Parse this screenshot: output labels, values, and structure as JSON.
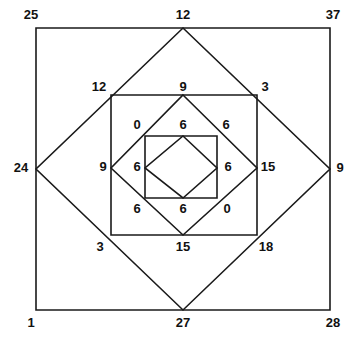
{
  "figure": {
    "type": "geometric-diagram",
    "stroke_color": "#1a1a1a",
    "background_color": "#ffffff",
    "label_color": "#111111",
    "shapes": [
      {
        "name": "outer-square",
        "kind": "square",
        "points": "36,28 330,28 330,310 36,310"
      },
      {
        "name": "outer-diamond",
        "kind": "diamond",
        "points": "183,28 330,169 183,310 36,169"
      },
      {
        "name": "middle-square",
        "kind": "square",
        "points": "111,95 257,95 257,235 111,235"
      },
      {
        "name": "middle-diamond",
        "kind": "diamond",
        "points": "183,95 257,168 183,235 111,168"
      },
      {
        "name": "inner-square",
        "kind": "square",
        "points": "145,136 217,136 217,198 145,198"
      },
      {
        "name": "inner-diamond",
        "kind": "diamond",
        "points": "183,136 217,168 183,198 145,168"
      }
    ],
    "labels": [
      {
        "name": "label-outer-top-left",
        "value": "25",
        "x": 31,
        "y": 16,
        "anchor": "middle"
      },
      {
        "name": "label-outer-top-mid",
        "value": "12",
        "x": 183,
        "y": 16,
        "anchor": "middle"
      },
      {
        "name": "label-outer-top-right",
        "value": "37",
        "x": 333,
        "y": 16,
        "anchor": "middle"
      },
      {
        "name": "label-outer-left-mid",
        "value": "24",
        "x": 21,
        "y": 169,
        "anchor": "middle"
      },
      {
        "name": "label-outer-right-mid",
        "value": "9",
        "x": 340,
        "y": 169,
        "anchor": "middle"
      },
      {
        "name": "label-outer-bottom-left",
        "value": "1",
        "x": 31,
        "y": 324,
        "anchor": "middle"
      },
      {
        "name": "label-outer-bottom-mid",
        "value": "27",
        "x": 183,
        "y": 324,
        "anchor": "middle"
      },
      {
        "name": "label-outer-bottom-right",
        "value": "28",
        "x": 333,
        "y": 324,
        "anchor": "middle"
      },
      {
        "name": "label-middle-top-left",
        "value": "12",
        "x": 99,
        "y": 88,
        "anchor": "middle"
      },
      {
        "name": "label-middle-top-mid",
        "value": "9",
        "x": 183,
        "y": 88,
        "anchor": "middle"
      },
      {
        "name": "label-middle-top-right",
        "value": "3",
        "x": 265,
        "y": 88,
        "anchor": "middle"
      },
      {
        "name": "label-middle-left-mid",
        "value": "9",
        "x": 103,
        "y": 168,
        "anchor": "middle"
      },
      {
        "name": "label-middle-right-mid",
        "value": "15",
        "x": 268,
        "y": 168,
        "anchor": "middle"
      },
      {
        "name": "label-middle-bottom-left",
        "value": "3",
        "x": 100,
        "y": 248,
        "anchor": "middle"
      },
      {
        "name": "label-middle-bottom-mid",
        "value": "15",
        "x": 183,
        "y": 248,
        "anchor": "middle"
      },
      {
        "name": "label-middle-bottom-right",
        "value": "18",
        "x": 266,
        "y": 248,
        "anchor": "middle"
      },
      {
        "name": "label-inner-top-left",
        "value": "0",
        "x": 137,
        "y": 126,
        "anchor": "middle"
      },
      {
        "name": "label-inner-top-mid",
        "value": "6",
        "x": 183,
        "y": 126,
        "anchor": "middle"
      },
      {
        "name": "label-inner-top-right",
        "value": "6",
        "x": 226,
        "y": 126,
        "anchor": "middle"
      },
      {
        "name": "label-inner-left-mid",
        "value": "6",
        "x": 137,
        "y": 168,
        "anchor": "middle"
      },
      {
        "name": "label-inner-right-mid",
        "value": "6",
        "x": 228,
        "y": 168,
        "anchor": "middle"
      },
      {
        "name": "label-inner-bottom-left",
        "value": "6",
        "x": 137,
        "y": 210,
        "anchor": "middle"
      },
      {
        "name": "label-inner-bottom-mid",
        "value": "6",
        "x": 183,
        "y": 210,
        "anchor": "middle"
      },
      {
        "name": "label-inner-bottom-right",
        "value": "0",
        "x": 227,
        "y": 210,
        "anchor": "middle"
      }
    ]
  }
}
